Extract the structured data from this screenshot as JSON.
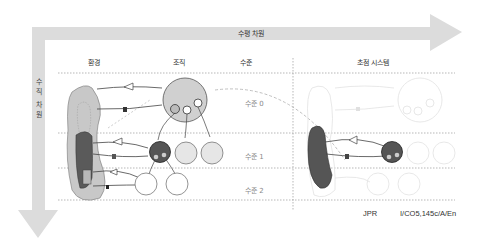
{
  "diagram": {
    "axes": {
      "horizontal_label": "수평 차원",
      "vertical_label_lines": [
        "수",
        "직",
        "차",
        "원"
      ]
    },
    "columns": {
      "environment": "환경",
      "organization": "조직",
      "level": "수준",
      "control_system": "초점 시스템"
    },
    "levels": [
      "수준 0",
      "수준 1",
      "수준 2"
    ],
    "footer": {
      "author": "JPR",
      "code": "I/CO5,145c/A/En"
    },
    "colors": {
      "arrow_fill": "#d9d9d9",
      "env_outer": "#c8c8c8",
      "env_dark": "#5a5a5a",
      "org_level0": "#d0d0d0",
      "org_level1_dark": "#555555",
      "org_level1_light": "#e6e6e6",
      "faded": "#e4e4e4",
      "dotted_line": "#9a9a9a"
    }
  }
}
